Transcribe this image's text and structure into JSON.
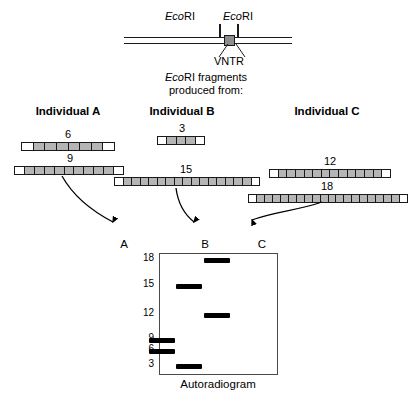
{
  "top_map": {
    "enzyme_left": {
      "italic": "Eco",
      "rest": "RI"
    },
    "enzyme_right": {
      "italic": "Eco",
      "rest": "RI"
    },
    "vntr_label": "VNTR"
  },
  "caption": {
    "line1_italic": "Eco",
    "line1_rest": "RI fragments",
    "line2": "produced from:"
  },
  "individuals": [
    {
      "title": "Individual A",
      "fragments": [
        {
          "label": "6",
          "repeats": 8
        },
        {
          "label": "9",
          "repeats": 11
        }
      ]
    },
    {
      "title": "Individual B",
      "fragments": [
        {
          "label": "3",
          "repeats": 5
        },
        {
          "label": "15",
          "repeats": 17
        }
      ]
    },
    {
      "title": "Individual C",
      "fragments": [
        {
          "label": "12",
          "repeats": 14
        },
        {
          "label": "18",
          "repeats": 20
        }
      ]
    }
  ],
  "gel": {
    "caption": "Autoradiogram",
    "lanes": [
      "A",
      "B",
      "C"
    ],
    "size_markers": [
      "18",
      "15",
      "12",
      "9",
      "6",
      "3"
    ],
    "bands": [
      {
        "lane": "A",
        "size": "9"
      },
      {
        "lane": "A",
        "size": "6"
      },
      {
        "lane": "B",
        "size": "15"
      },
      {
        "lane": "B",
        "size": "3"
      },
      {
        "lane": "C",
        "size": "18"
      },
      {
        "lane": "C",
        "size": "12"
      }
    ]
  },
  "colors": {
    "ink": "#000000",
    "repeat_fill": "#b5b5b5",
    "vntr_fill": "#8c8c8c",
    "gel_border": "#4a4a4a"
  }
}
